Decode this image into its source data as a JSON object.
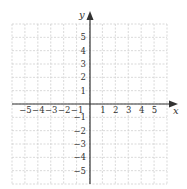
{
  "diagram": {
    "type": "cartesian-coordinate-plane",
    "x_axis": {
      "label": "x",
      "tick_labels": [
        "−5",
        "−4",
        "−3",
        "−2",
        "−1",
        "1",
        "2",
        "3",
        "4",
        "5"
      ],
      "tick_values": [
        -5,
        -4,
        -3,
        -2,
        -1,
        1,
        2,
        3,
        4,
        5
      ],
      "range": [
        -6,
        6
      ]
    },
    "y_axis": {
      "label": "y",
      "tick_labels": [
        "5",
        "4",
        "3",
        "2",
        "1",
        "−1",
        "−2",
        "−3",
        "−4",
        "−5"
      ],
      "tick_values": [
        5,
        4,
        3,
        2,
        1,
        -1,
        -2,
        -3,
        -4,
        -5
      ],
      "range": [
        -6,
        6
      ]
    },
    "grid": {
      "visible": true,
      "style": "dashed",
      "color": "#cfcfcf",
      "cells_x": 12,
      "cells_y": 12
    },
    "colors": {
      "axis": "#333333",
      "background": "#ffffff"
    }
  }
}
